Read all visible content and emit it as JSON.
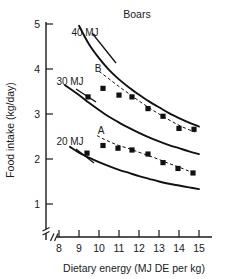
{
  "chart_data": {
    "type": "line",
    "title": "Boars",
    "xlabel": "Dietary energy (MJ DE per kg)",
    "ylabel": "Food intake (kg/day)",
    "xlim": [
      7.4,
      15.4
    ],
    "ylim": [
      0.85,
      5.15
    ],
    "xticks": [
      8,
      9,
      10,
      11,
      12,
      13,
      14,
      15
    ],
    "yticks": [
      1,
      2,
      3,
      4,
      5
    ],
    "xtick_labels": [
      "8",
      "9",
      "10",
      "11",
      "12",
      "13",
      "14",
      "15"
    ],
    "ytick_labels": [
      "1",
      "2",
      "3",
      "4",
      "5"
    ],
    "grid": false,
    "legend": "none",
    "axis_break_x": true,
    "axis_break_y": true,
    "annotations": [
      {
        "name": "curve-label-40mj",
        "text": "40 MJ",
        "x": 9.3,
        "y": 4.82
      },
      {
        "name": "curve-label-30mj",
        "text": "30 MJ",
        "x": 8.55,
        "y": 3.72
      },
      {
        "name": "curve-label-20mj",
        "text": "20 MJ",
        "x": 8.55,
        "y": 2.38
      },
      {
        "name": "fit-label-b",
        "text": "B",
        "x": 9.95,
        "y": 4.02
      },
      {
        "name": "fit-label-a",
        "text": "A",
        "x": 10.1,
        "y": 2.63
      }
    ],
    "series": [
      {
        "name": "40 MJ",
        "style": "solid",
        "kind": "model-curve",
        "x": [
          9.0,
          9.5,
          10.0,
          10.5,
          11.0,
          11.5,
          12.0,
          12.5,
          13.0,
          13.5,
          14.0,
          14.5,
          15.0
        ],
        "values": [
          4.96,
          4.55,
          4.24,
          3.98,
          3.77,
          3.59,
          3.43,
          3.28,
          3.15,
          3.02,
          2.91,
          2.81,
          2.72
        ]
      },
      {
        "name": "30 MJ",
        "style": "solid",
        "kind": "model-curve",
        "x": [
          8.3,
          9.0,
          9.5,
          10.0,
          10.5,
          11.0,
          11.5,
          12.0,
          12.5,
          13.0,
          13.5,
          14.0,
          14.5,
          15.0
        ],
        "values": [
          3.64,
          3.42,
          3.25,
          3.09,
          2.94,
          2.81,
          2.69,
          2.58,
          2.48,
          2.39,
          2.31,
          2.24,
          2.17,
          2.11
        ]
      },
      {
        "name": "20 MJ",
        "style": "solid",
        "kind": "model-curve",
        "x": [
          8.55,
          9.0,
          9.5,
          10.0,
          10.5,
          11.0,
          11.5,
          12.0,
          12.5,
          13.0,
          13.5,
          14.0,
          14.5,
          15.0
        ],
        "values": [
          2.27,
          2.14,
          2.03,
          1.93,
          1.84,
          1.76,
          1.69,
          1.62,
          1.56,
          1.5,
          1.45,
          1.41,
          1.37,
          1.33
        ]
      },
      {
        "name": "B",
        "style": "dashed",
        "kind": "fitted-line",
        "x": [
          10.0,
          10.5,
          11.0,
          11.5,
          12.0,
          12.5,
          13.0,
          13.5,
          14.0,
          14.5,
          14.8
        ],
        "values": [
          3.95,
          3.78,
          3.61,
          3.45,
          3.29,
          3.14,
          3.0,
          2.87,
          2.75,
          2.65,
          2.6
        ]
      },
      {
        "name": "A",
        "style": "dashed",
        "kind": "fitted-line",
        "x": [
          9.9,
          10.2,
          10.6,
          11.0,
          11.5,
          12.0,
          12.5,
          13.0,
          13.5,
          14.0,
          14.5,
          14.8
        ],
        "values": [
          2.52,
          2.45,
          2.37,
          2.3,
          2.23,
          2.15,
          2.07,
          1.99,
          1.9,
          1.82,
          1.73,
          1.68
        ]
      }
    ],
    "points": [
      {
        "series": "B",
        "marker": "filled-square",
        "x": [
          9.45,
          10.2,
          11.0,
          11.65,
          12.45,
          13.2,
          14.0,
          14.75
        ],
        "values": [
          3.38,
          3.57,
          3.42,
          3.38,
          3.12,
          2.95,
          2.68,
          2.66
        ]
      },
      {
        "series": "A",
        "marker": "filled-square",
        "x": [
          9.4,
          10.2,
          10.95,
          11.65,
          12.45,
          13.2,
          13.95,
          14.7
        ],
        "values": [
          2.13,
          2.3,
          2.24,
          2.2,
          2.11,
          1.92,
          1.79,
          1.69
        ]
      }
    ]
  }
}
